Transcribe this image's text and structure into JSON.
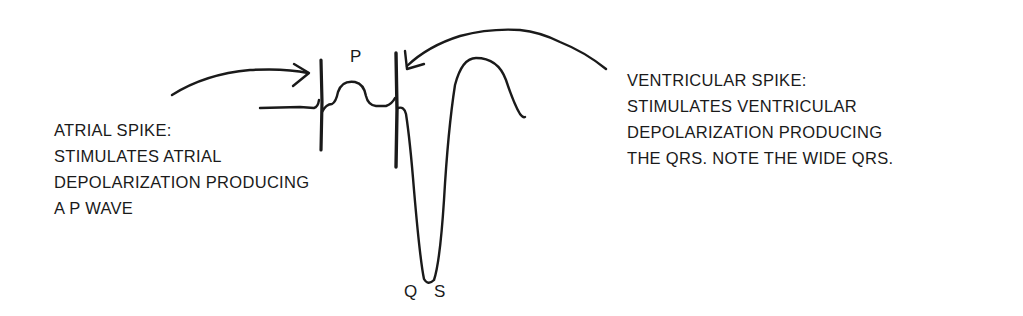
{
  "diagram": {
    "wave_labels": {
      "p": "P",
      "q": "Q",
      "s": "S"
    },
    "atrial_annotation": {
      "lines": [
        "ATRIAL SPIKE:",
        "STIMULATES ATRIAL",
        "DEPOLARIZATION PRODUCING",
        "A P WAVE"
      ]
    },
    "ventricular_annotation": {
      "lines": [
        "VENTRICULAR SPIKE:",
        "STIMULATES VENTRICULAR",
        "DEPOLARIZATION PRODUCING",
        "THE QRS. NOTE THE WIDE QRS."
      ]
    },
    "colors": {
      "ink": "#1a1a1a",
      "background": "#ffffff"
    }
  }
}
